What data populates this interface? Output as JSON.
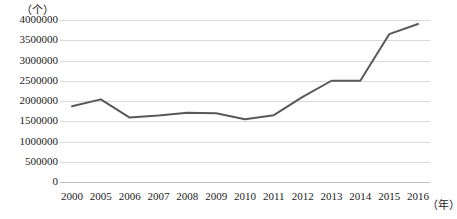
{
  "chart_data": {
    "type": "line",
    "title": "",
    "subtitle": "",
    "xlabel": "（年）",
    "ylabel": "（个）",
    "categories": [
      "2000",
      "2005",
      "2006",
      "2007",
      "2008",
      "2009",
      "2010",
      "2011",
      "2012",
      "2013",
      "2014",
      "2015",
      "2016"
    ],
    "values": [
      1870000,
      2040000,
      1590000,
      1640000,
      1710000,
      1700000,
      1550000,
      1650000,
      2100000,
      2500000,
      2500000,
      3650000,
      3900000
    ],
    "series": [
      {
        "name": "数量",
        "values": [
          1870000,
          2040000,
          1590000,
          1640000,
          1710000,
          1700000,
          1550000,
          1650000,
          2100000,
          2500000,
          2500000,
          3650000,
          3900000
        ],
        "color": "#595959"
      }
    ],
    "ylim": [
      0,
      4000000
    ],
    "ytick_labels": [
      "4000000",
      "3500000",
      "3000000",
      "2500000",
      "2000000",
      "1500000",
      "1000000",
      "500000",
      "0"
    ],
    "ytick_values": [
      4000000,
      3500000,
      3000000,
      2500000,
      2000000,
      1500000,
      1000000,
      500000,
      0
    ],
    "grid": true,
    "grid_color": "#d9d9d9",
    "legend": false,
    "legend_position": "none",
    "markers": false,
    "line_color": "#595959",
    "background_color": "#ffffff"
  }
}
